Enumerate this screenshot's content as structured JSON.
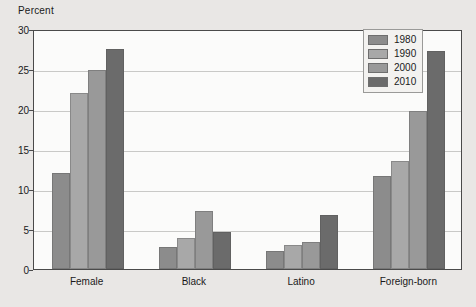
{
  "chart_data": {
    "type": "bar",
    "title": "",
    "xlabel": "",
    "ylabel": "Percent",
    "ylim": [
      0,
      30
    ],
    "yticks": [
      0,
      5,
      10,
      15,
      20,
      25,
      30
    ],
    "ytick_labels": [
      "0",
      "5",
      "10",
      "15",
      "20",
      "25",
      "30"
    ],
    "grid": true,
    "legend_position": "top-right",
    "categories": [
      "Female",
      "Black",
      "Latino",
      "Foreign-born"
    ],
    "series": [
      {
        "name": "1980",
        "color": "#8c8c8c",
        "values": [
          12.0,
          2.8,
          2.2,
          11.6
        ]
      },
      {
        "name": "1990",
        "color": "#a8a8a8",
        "values": [
          22.0,
          3.9,
          3.0,
          13.5
        ]
      },
      {
        "name": "2000",
        "color": "#999999",
        "values": [
          24.9,
          7.2,
          3.4,
          19.7
        ]
      },
      {
        "name": "2010",
        "color": "#6b6b6b",
        "values": [
          27.5,
          4.6,
          6.8,
          27.2
        ]
      }
    ]
  },
  "legend": {
    "items": [
      {
        "label": "1980"
      },
      {
        "label": "1990"
      },
      {
        "label": "2000"
      },
      {
        "label": "2010"
      }
    ]
  },
  "colors": {
    "page_background": "#e9e7e5",
    "plot_background": "#fbfbfa",
    "axis": "#4a4a4a",
    "gridline": "#c9c9c7",
    "text": "#1a1a1a"
  }
}
